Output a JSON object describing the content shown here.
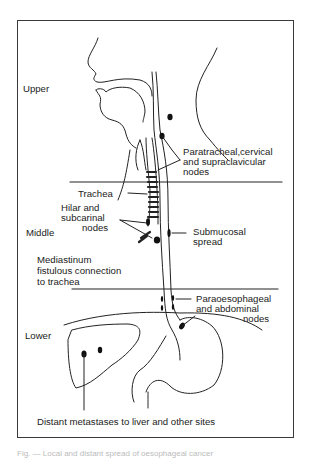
{
  "figure": {
    "region_labels": {
      "upper": "Upper",
      "middle": "Middle",
      "lower": "Lower"
    },
    "annotations": {
      "paratracheal_l1": "Paratracheal,cervical",
      "paratracheal_l2": "and supraclavicular",
      "paratracheal_l3": "nodes",
      "trachea": "Trachea",
      "hilar_l1": "Hilar and",
      "hilar_l2": "subcarinal",
      "hilar_l3": "nodes",
      "submucosal_l1": "Submucosal",
      "submucosal_l2": "spread",
      "mediastinum_l1": "Mediastinum",
      "mediastinum_l2": "fistulous connection",
      "mediastinum_l3": "to trachea",
      "paraoesophageal_l1": "Paraoesophageal",
      "paraoesophageal_l2": "and abdominal",
      "paraoesophageal_l3": "nodes",
      "distant": "Distant metastases to liver and other sites"
    },
    "caption": "Fig. — Local and distant spread of oesophageal cancer"
  }
}
